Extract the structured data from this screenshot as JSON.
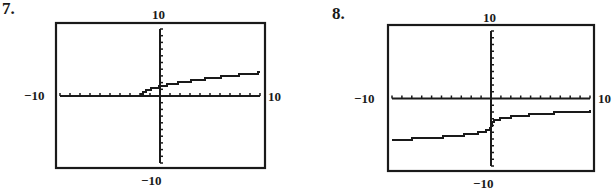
{
  "chart_data": [
    {
      "type": "line",
      "problem_number": "7.",
      "title": "",
      "xlabel": "",
      "ylabel": "",
      "xlim": [
        -10,
        10
      ],
      "ylim": [
        -10,
        10
      ],
      "xtick_step": 1,
      "ytick_step": 1,
      "grid": false,
      "window_labels": {
        "ymax": "10",
        "ymin": "−10",
        "xmin": "−10",
        "xmax": "10"
      },
      "series": [
        {
          "name": "curve",
          "function_estimate": "y = sqrt(x + 2)",
          "x": [
            -2,
            -1.5,
            -1,
            0,
            1,
            2,
            3,
            4,
            5,
            6,
            7,
            8,
            9,
            10
          ],
          "values": [
            0,
            0.71,
            1.0,
            1.41,
            1.73,
            2.0,
            2.24,
            2.45,
            2.65,
            2.83,
            3.0,
            3.16,
            3.32,
            3.46
          ]
        }
      ]
    },
    {
      "type": "line",
      "problem_number": "8.",
      "title": "",
      "xlabel": "",
      "ylabel": "",
      "xlim": [
        -10,
        10
      ],
      "ylim": [
        -10,
        10
      ],
      "xtick_step": 1,
      "ytick_step": 1,
      "grid": false,
      "window_labels": {
        "ymax": "10",
        "ymin": "−10",
        "xmin": "−10",
        "xmax": "10"
      },
      "series": [
        {
          "name": "curve",
          "function_estimate": "y = cbrt(x) - 4",
          "x": [
            -10,
            -8,
            -6,
            -4,
            -2,
            -1,
            -0.3,
            0,
            0.3,
            1,
            2,
            4,
            6,
            8,
            10
          ],
          "values": [
            -6.15,
            -6.0,
            -5.82,
            -5.59,
            -5.26,
            -5.0,
            -4.67,
            -4.0,
            -3.33,
            -3.0,
            -2.74,
            -2.41,
            -2.18,
            -2.0,
            -1.85
          ]
        }
      ]
    }
  ],
  "graphs": [
    {
      "number": "7.",
      "top": "10",
      "bottom": "−10",
      "left": "−10",
      "right": "10"
    },
    {
      "number": "8.",
      "top": "10",
      "bottom": "−10",
      "left": "−10",
      "right": "10"
    }
  ]
}
